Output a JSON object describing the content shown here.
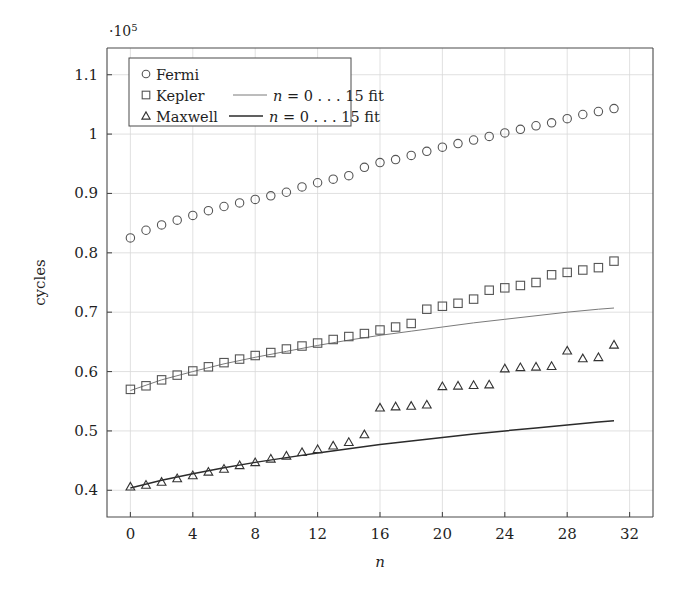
{
  "chart_data": {
    "type": "scatter",
    "title": "",
    "xlabel": "n",
    "ylabel": "cycles",
    "y_axis_multiplier": "·10⁵",
    "y_multiplier_base": "·10",
    "y_multiplier_exp": "5",
    "xlim": [
      -1.5,
      33.5
    ],
    "ylim": [
      0.355,
      1.145
    ],
    "xticks": [
      0,
      4,
      8,
      12,
      16,
      20,
      24,
      28,
      32
    ],
    "xtick_labels": [
      "0",
      "4",
      "8",
      "12",
      "16",
      "20",
      "24",
      "28",
      "32"
    ],
    "yticks": [
      0.4,
      0.5,
      0.6,
      0.7,
      0.8,
      0.9,
      1.0,
      1.1
    ],
    "ytick_labels": [
      "0.4",
      "0.5",
      "0.6",
      "0.7",
      "0.8",
      "0.9",
      "1",
      "1.1"
    ],
    "grid": true,
    "legend_position": "upper-left",
    "x": [
      0,
      1,
      2,
      3,
      4,
      5,
      6,
      7,
      8,
      9,
      10,
      11,
      12,
      13,
      14,
      15,
      16,
      17,
      18,
      19,
      20,
      21,
      22,
      23,
      24,
      25,
      26,
      27,
      28,
      29,
      30,
      31
    ],
    "series": [
      {
        "name": "Fermi",
        "marker": "circle",
        "color": "#555555",
        "values": [
          0.825,
          0.838,
          0.847,
          0.855,
          0.863,
          0.871,
          0.878,
          0.884,
          0.89,
          0.896,
          0.902,
          0.911,
          0.918,
          0.924,
          0.93,
          0.944,
          0.952,
          0.957,
          0.964,
          0.971,
          0.978,
          0.984,
          0.99,
          0.996,
          1.002,
          1.008,
          1.014,
          1.019,
          1.026,
          1.033,
          1.038,
          1.043
        ]
      },
      {
        "name": "Kepler",
        "marker": "square",
        "color": "#555555",
        "values": [
          0.57,
          0.576,
          0.586,
          0.594,
          0.601,
          0.608,
          0.615,
          0.621,
          0.627,
          0.632,
          0.638,
          0.643,
          0.648,
          0.654,
          0.659,
          0.664,
          0.67,
          0.675,
          0.681,
          0.705,
          0.71,
          0.715,
          0.722,
          0.737,
          0.741,
          0.745,
          0.75,
          0.763,
          0.767,
          0.771,
          0.775,
          0.786
        ]
      },
      {
        "name": "Maxwell",
        "marker": "triangle",
        "color": "#333333",
        "values": [
          0.406,
          0.409,
          0.414,
          0.42,
          0.425,
          0.431,
          0.436,
          0.442,
          0.447,
          0.453,
          0.458,
          0.464,
          0.469,
          0.475,
          0.481,
          0.494,
          0.539,
          0.541,
          0.542,
          0.544,
          0.575,
          0.576,
          0.577,
          0.578,
          0.605,
          0.607,
          0.608,
          0.609,
          0.635,
          0.622,
          0.624,
          0.645
        ]
      }
    ],
    "fits": [
      {
        "name": "Kepler fit",
        "label": "n = 0 . . . 15 fit",
        "label_var": "n",
        "label_rest": "= 0 . . . 15 fit",
        "for_series": "Kepler",
        "color": "#7a7a7a",
        "width": 1.0,
        "x": [
          0,
          2,
          4,
          6,
          8,
          10,
          12,
          14,
          16,
          18,
          20,
          22,
          24,
          26,
          28,
          30,
          31
        ],
        "y": [
          0.568,
          0.586,
          0.6,
          0.613,
          0.624,
          0.634,
          0.644,
          0.653,
          0.661,
          0.668,
          0.675,
          0.682,
          0.688,
          0.694,
          0.7,
          0.705,
          0.707
        ]
      },
      {
        "name": "Maxwell fit",
        "label": "n = 0 . . . 15 fit",
        "label_var": "n",
        "label_rest": "= 0 . . . 15 fit",
        "for_series": "Maxwell",
        "color": "#2b2b2b",
        "width": 1.5,
        "x": [
          0,
          2,
          4,
          6,
          8,
          10,
          12,
          14,
          16,
          18,
          20,
          22,
          24,
          26,
          28,
          30,
          31
        ],
        "y": [
          0.404,
          0.417,
          0.428,
          0.438,
          0.447,
          0.455,
          0.463,
          0.47,
          0.477,
          0.483,
          0.489,
          0.495,
          0.5,
          0.505,
          0.51,
          0.515,
          0.517
        ]
      }
    ],
    "legend": {
      "entries": [
        {
          "label": "Fermi",
          "marker": "circle",
          "fit_label": ""
        },
        {
          "label": "Kepler",
          "marker": "square",
          "fit_label": "= 0 . . . 15 fit",
          "fit_var": "n"
        },
        {
          "label": "Maxwell",
          "marker": "triangle",
          "fit_label": "= 0 . . . 15 fit",
          "fit_var": "n"
        }
      ]
    }
  }
}
